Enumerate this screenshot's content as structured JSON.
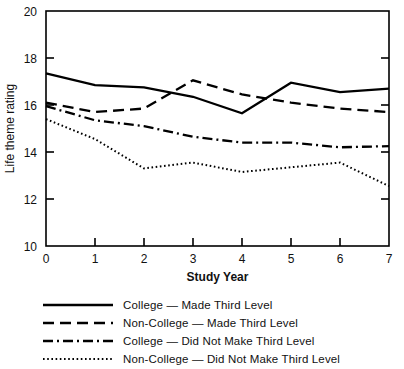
{
  "chart_data": {
    "type": "line",
    "title": "",
    "xlabel": "Study Year",
    "ylabel": "Life theme rating",
    "x": [
      0,
      1,
      2,
      3,
      4,
      5,
      6,
      7
    ],
    "xlim": [
      0,
      7
    ],
    "ylim": [
      10,
      20
    ],
    "xticks": [
      "0",
      "1",
      "2",
      "3",
      "4",
      "5",
      "6",
      "7"
    ],
    "yticks": [
      "10",
      "12",
      "14",
      "16",
      "18",
      "20"
    ],
    "grid": false,
    "legend_position": "below-plot",
    "series": [
      {
        "name": "College — Made Third Level",
        "style": "solid",
        "values": [
          17.35,
          16.85,
          16.75,
          16.35,
          15.65,
          16.95,
          16.55,
          16.7
        ]
      },
      {
        "name": "Non-College — Made Third Level",
        "style": "dashed",
        "values": [
          16.1,
          15.7,
          15.85,
          17.05,
          16.45,
          16.1,
          15.85,
          15.7
        ]
      },
      {
        "name": "College — Did Not Make Third Level",
        "style": "dash-dot",
        "values": [
          15.95,
          15.35,
          15.1,
          14.65,
          14.4,
          14.4,
          14.2,
          14.25
        ]
      },
      {
        "name": "Non-College — Did Not Make Third Level",
        "style": "dotted",
        "values": [
          15.4,
          14.55,
          13.3,
          13.55,
          13.15,
          13.35,
          13.55,
          12.55
        ]
      }
    ]
  },
  "legend": {
    "items": [
      {
        "label": "College — Made Third Level",
        "style": "solid"
      },
      {
        "label": "Non-College — Made Third Level",
        "style": "dashed"
      },
      {
        "label": "College — Did Not Make Third Level",
        "style": "dash-dot"
      },
      {
        "label": "Non-College — Did Not Make Third Level",
        "style": "dotted"
      }
    ]
  },
  "colors": {
    "line": "#000000",
    "axis": "#000000",
    "background": "#ffffff",
    "text": "#111111"
  }
}
